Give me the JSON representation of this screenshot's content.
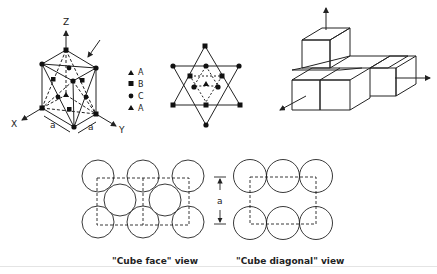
{
  "figure": {
    "unit_cell": {
      "axis_labels": {
        "z": "Z",
        "x": "X",
        "y": "Y"
      },
      "edge_labels": [
        "a",
        "a"
      ]
    },
    "legend": {
      "items": [
        {
          "marker": "triangle",
          "label": "A"
        },
        {
          "marker": "square",
          "label": "B"
        },
        {
          "marker": "circle",
          "label": "C"
        },
        {
          "marker": "triangle",
          "label": "A"
        }
      ]
    },
    "cube_face_view": {
      "caption": "\"Cube face\" view"
    },
    "cube_diagonal_view": {
      "caption": "\"Cube diagonal\" view",
      "dimension_label": "a"
    }
  },
  "colors": {
    "ink": "#222222",
    "background": "#ffffff"
  }
}
